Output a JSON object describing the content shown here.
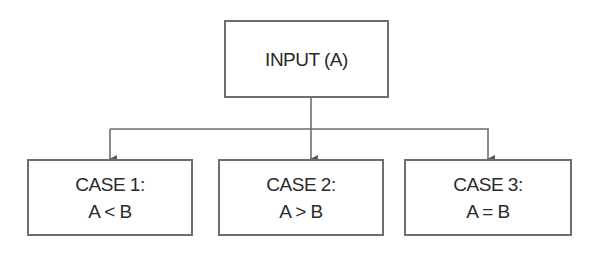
{
  "diagram": {
    "type": "flowchart",
    "root": {
      "label": "INPUT (A)"
    },
    "cases": [
      {
        "title": "CASE 1:",
        "condition": "A < B"
      },
      {
        "title": "CASE 2:",
        "condition": "A > B"
      },
      {
        "title": "CASE 3:",
        "condition": "A = B"
      }
    ],
    "colors": {
      "line": "#6e6e6e",
      "text": "#2a2a2a",
      "background": "#ffffff"
    }
  }
}
